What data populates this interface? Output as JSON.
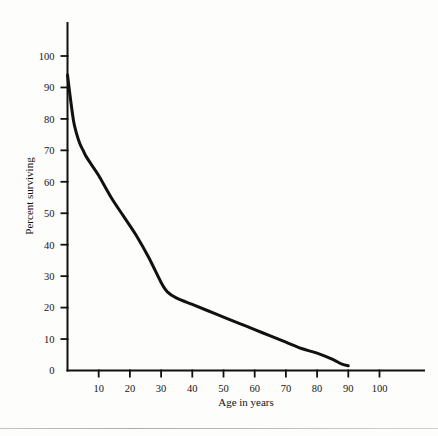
{
  "chart_data": {
    "type": "line",
    "title": "",
    "xlabel": "Age in years",
    "ylabel": "Percent surviving",
    "xlim": [
      0,
      105
    ],
    "ylim": [
      0,
      105
    ],
    "grid": false,
    "legend": "none",
    "xticks": [
      10,
      20,
      30,
      40,
      50,
      60,
      70,
      80,
      90,
      100
    ],
    "yticks": [
      0,
      10,
      20,
      30,
      40,
      50,
      60,
      70,
      80,
      90,
      100
    ],
    "xtick_labels": [
      "10",
      "20",
      "30",
      "40",
      "50",
      "60",
      "70",
      "80",
      "90",
      "100"
    ],
    "ytick_labels": [
      "0",
      "10",
      "20",
      "30",
      "40",
      "50",
      "60",
      "70",
      "80",
      "90",
      "100"
    ],
    "series": [
      {
        "name": "Percent surviving",
        "color": "#111111",
        "x": [
          0,
          1,
          2,
          3,
          4,
          5,
          6,
          8,
          10,
          14,
          18,
          22,
          26,
          30,
          32,
          35,
          40,
          45,
          50,
          55,
          60,
          65,
          70,
          75,
          80,
          85,
          88,
          90
        ],
        "y": [
          94,
          86,
          79,
          75,
          72,
          70,
          68,
          65,
          62,
          55,
          49,
          43,
          36,
          28,
          25,
          23,
          21,
          19,
          17,
          15,
          13,
          11,
          9,
          7,
          5.5,
          3.5,
          2,
          1.5
        ]
      }
    ]
  },
  "axes": {
    "y_axis_label": "Percent surviving",
    "x_axis_label": "Age in years"
  }
}
